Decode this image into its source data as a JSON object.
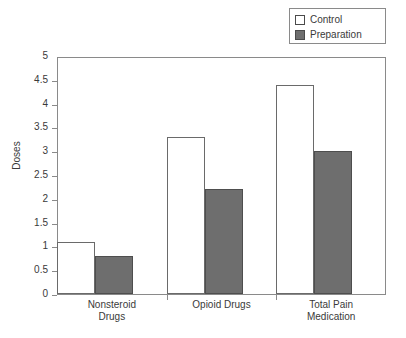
{
  "chart_data": {
    "type": "bar",
    "title": "",
    "xlabel": "",
    "ylabel": "Doses",
    "ylim": [
      0,
      5
    ],
    "yticks": [
      "0",
      "0.5",
      "1",
      "1.5",
      "2",
      "2.5",
      "3",
      "3.5",
      "4",
      "4.5",
      "5"
    ],
    "grid": false,
    "legend_position": "top-right",
    "categories": [
      "Nonsteroid\nDrugs",
      "Opioid Drugs",
      "Total Pain\nMedication"
    ],
    "series": [
      {
        "name": "Control",
        "color": "#ffffff",
        "values": [
          1.1,
          3.3,
          4.4
        ]
      },
      {
        "name": "Preparation",
        "color": "#6e6e6e",
        "values": [
          0.8,
          2.2,
          3.0
        ]
      }
    ]
  },
  "legend": {
    "items": [
      {
        "label": "Control",
        "swatch": "white-square-swatch"
      },
      {
        "label": "Preparation",
        "swatch": "dark-gray-square-swatch"
      }
    ]
  },
  "axes": {
    "y_title": "Doses"
  }
}
